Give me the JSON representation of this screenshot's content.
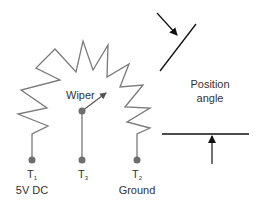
{
  "diagram": {
    "type": "potentiometer-schematic",
    "colors": {
      "resistor": "#777777",
      "angle_lines": "#111111",
      "terminal": "#6e6e6e",
      "text": "#333333"
    },
    "labels": {
      "wiper": "Wiper",
      "position_angle_line1": "Position",
      "position_angle_line2": "angle"
    },
    "terminals": [
      {
        "name": "T",
        "sub": "1",
        "desc": "5V DC"
      },
      {
        "name": "T",
        "sub": "3",
        "desc": ""
      },
      {
        "name": "T",
        "sub": "2",
        "desc": "Ground"
      }
    ]
  }
}
